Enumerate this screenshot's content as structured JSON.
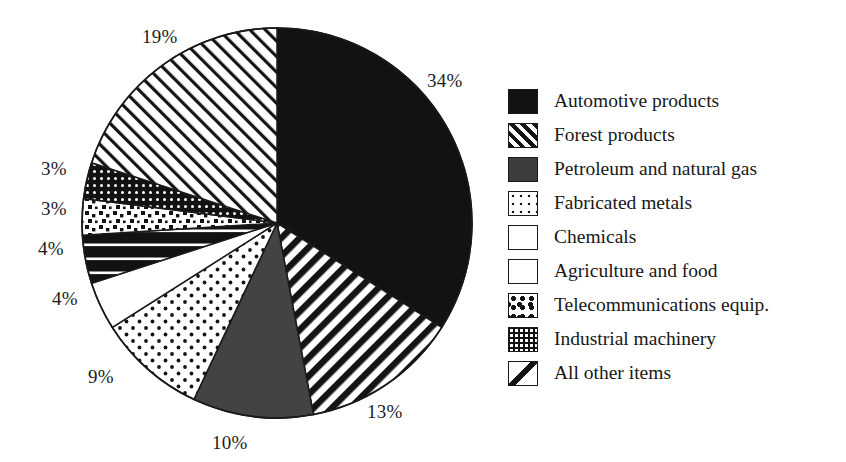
{
  "chart_data": {
    "type": "pie",
    "title": "",
    "subtitle": "",
    "xlabel": "",
    "ylabel": "",
    "legend_position": "right",
    "grid": false,
    "units": "percent",
    "total": 99,
    "categories": [
      "Automotive products",
      "Forest products",
      "Petroleum and natural gas",
      "Fabricated metals",
      "Chemicals",
      "Agriculture and food",
      "Telecommunications equip.",
      "Industrial machinery",
      "All other items"
    ],
    "values": [
      34,
      13,
      10,
      9,
      4,
      4,
      3,
      3,
      19
    ],
    "labels": [
      "34%",
      "13%",
      "10%",
      "9%",
      "4%",
      "4%",
      "3%",
      "3%",
      "19%"
    ],
    "slices": [
      {
        "name": "Automotive products",
        "value": 34,
        "label": "34%",
        "pattern": "solid-black",
        "start_deg": 0,
        "end_deg": 122.4
      },
      {
        "name": "Forest products",
        "value": 13,
        "label": "13%",
        "pattern": "diag-thick",
        "start_deg": 122.4,
        "end_deg": 169.2
      },
      {
        "name": "Petroleum and natural gas",
        "value": 10,
        "label": "10%",
        "pattern": "solid-dark",
        "start_deg": 169.2,
        "end_deg": 205.2
      },
      {
        "name": "Fabricated metals",
        "value": 9,
        "label": "9%",
        "pattern": "dots-open",
        "start_deg": 205.2,
        "end_deg": 237.6
      },
      {
        "name": "Chemicals",
        "value": 4,
        "label": "4%",
        "pattern": "white",
        "start_deg": 237.6,
        "end_deg": 252.0
      },
      {
        "name": "Agriculture and food",
        "value": 4,
        "label": "4%",
        "pattern": "h-band",
        "start_deg": 252.0,
        "end_deg": 266.4
      },
      {
        "name": "Telecommunications equip.",
        "value": 3,
        "label": "3%",
        "pattern": "squares-scatter",
        "start_deg": 266.4,
        "end_deg": 277.2
      },
      {
        "name": "Industrial machinery",
        "value": 3,
        "label": "3%",
        "pattern": "grid-dots",
        "start_deg": 277.2,
        "end_deg": 288.0
      },
      {
        "name": "All other items",
        "value": 19,
        "label": "19%",
        "pattern": "diag-single",
        "start_deg": 288.0,
        "end_deg": 360.0
      }
    ],
    "colors": {
      "ink": "#141414",
      "paper": "#ffffff",
      "dark_gray": "#3d3d3d",
      "text": "#1a1a1a"
    }
  },
  "pie_labels": [
    {
      "text": "19%",
      "x": 142,
      "y": 26
    },
    {
      "text": "34%",
      "x": 427,
      "y": 70
    },
    {
      "text": "3%",
      "x": 41,
      "y": 158
    },
    {
      "text": "3%",
      "x": 41,
      "y": 198
    },
    {
      "text": "4%",
      "x": 38,
      "y": 238
    },
    {
      "text": "4%",
      "x": 52,
      "y": 288
    },
    {
      "text": "9%",
      "x": 88,
      "y": 366
    },
    {
      "text": "10%",
      "x": 212,
      "y": 432
    },
    {
      "text": "13%",
      "x": 367,
      "y": 401
    }
  ],
  "legend": {
    "items": [
      {
        "label": "Automotive products",
        "pattern": "solid-black"
      },
      {
        "label": "Forest products",
        "pattern": "diag-thick"
      },
      {
        "label": "Petroleum and natural gas",
        "pattern": "solid-dark"
      },
      {
        "label": "Fabricated metals",
        "pattern": "dots-open"
      },
      {
        "label": "Chemicals",
        "pattern": "white"
      },
      {
        "label": "Agriculture and food",
        "pattern": "h-band"
      },
      {
        "label": "Telecommunications equip.",
        "pattern": "squares-scatter"
      },
      {
        "label": "Industrial machinery",
        "pattern": "grid-dots"
      },
      {
        "label": "All other items",
        "pattern": "diag-single"
      }
    ]
  }
}
